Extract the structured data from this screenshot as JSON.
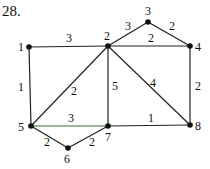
{
  "problem_number": "28.",
  "edge_color": "#222222",
  "highlight_edge_color": "#3a6b35",
  "nodes": [
    {
      "id": "1",
      "x": 29,
      "y": 47,
      "lx": 18,
      "ly": 51
    },
    {
      "id": "2",
      "x": 108,
      "y": 46,
      "lx": 104,
      "ly": 40
    },
    {
      "id": "3",
      "x": 148,
      "y": 22,
      "lx": 145,
      "ly": 15
    },
    {
      "id": "4",
      "x": 190,
      "y": 46,
      "lx": 195,
      "ly": 51
    },
    {
      "id": "5",
      "x": 31,
      "y": 126,
      "lx": 18,
      "ly": 131
    },
    {
      "id": "6",
      "x": 68,
      "y": 148,
      "lx": 64,
      "ly": 163
    },
    {
      "id": "7",
      "x": 108,
      "y": 126,
      "lx": 105,
      "ly": 141
    },
    {
      "id": "8",
      "x": 190,
      "y": 125,
      "lx": 195,
      "ly": 130
    }
  ],
  "edges": [
    {
      "from": "1",
      "to": "2",
      "weight": "3",
      "lx": 66,
      "ly": 42
    },
    {
      "from": "1",
      "to": "5",
      "weight": "1",
      "lx": 18,
      "ly": 91
    },
    {
      "from": "2",
      "to": "3",
      "weight": "3",
      "lx": 125,
      "ly": 30
    },
    {
      "from": "3",
      "to": "4",
      "weight": "2",
      "lx": 169,
      "ly": 30
    },
    {
      "from": "2",
      "to": "4",
      "weight": "2",
      "lx": 148,
      "ly": 42
    },
    {
      "from": "2",
      "to": "5",
      "weight": "2",
      "lx": 71,
      "ly": 95
    },
    {
      "from": "2",
      "to": "7",
      "weight": "5",
      "lx": 112,
      "ly": 90
    },
    {
      "from": "2",
      "to": "8",
      "weight": "4",
      "lx": 150,
      "ly": 87
    },
    {
      "from": "4",
      "to": "8",
      "weight": "2",
      "lx": 195,
      "ly": 90
    },
    {
      "from": "5",
      "to": "7",
      "weight": "3",
      "lx": 68,
      "ly": 122,
      "highlight": true
    },
    {
      "from": "7",
      "to": "8",
      "weight": "1",
      "lx": 148,
      "ly": 122
    },
    {
      "from": "5",
      "to": "6",
      "weight": "2",
      "lx": 44,
      "ly": 146
    },
    {
      "from": "6",
      "to": "7",
      "weight": "2",
      "lx": 89,
      "ly": 146
    }
  ]
}
